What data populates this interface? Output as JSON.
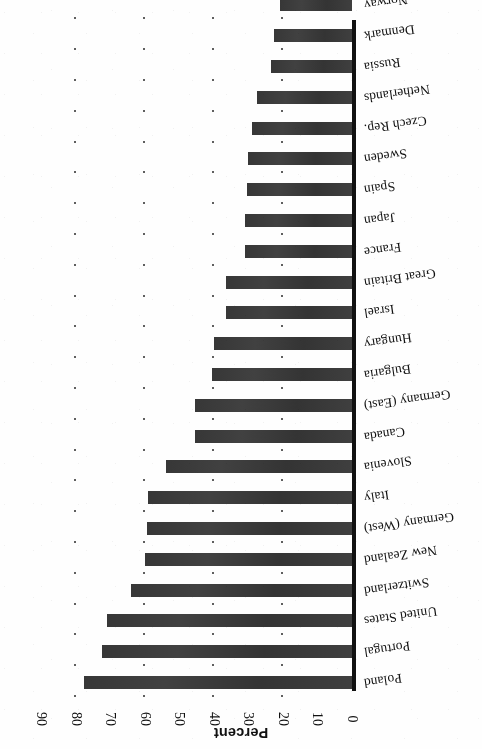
{
  "chart_data": {
    "type": "bar",
    "orientation": "horizontal",
    "title": "",
    "subtitle": "",
    "xlabel": "Percent",
    "ylabel": "",
    "xlim": [
      0,
      90
    ],
    "xticks": [
      0,
      10,
      20,
      30,
      40,
      50,
      60,
      70,
      80,
      90
    ],
    "xtick_labels": [
      "0",
      "10",
      "20",
      "30",
      "40",
      "50",
      "60",
      "70",
      "80",
      "90"
    ],
    "grid": "dotted",
    "grid_interval": 20,
    "legend": "none",
    "bar_color": "#3a3a3a",
    "axis_color": "#111111",
    "rotation_note": "figure rendered rotated 180 degrees",
    "categories": [
      "Poland",
      "Portugal",
      "United States",
      "Switzerland",
      "New Zealand",
      "Germany (West)",
      "Italy",
      "Slovenia",
      "Canada",
      "Germany (East)",
      "Bulgaria",
      "Hungary",
      "Israel",
      "Great Britain",
      "France",
      "Japan",
      "Spain",
      "Sweden",
      "Czech Rep.",
      "Netherlands",
      "Russia",
      "Denmark",
      "Norway"
    ],
    "values": [
      77.7,
      72.5,
      71.0,
      64.0,
      60.0,
      59.5,
      59.0,
      54.0,
      45.5,
      45.5,
      40.5,
      40.0,
      36.5,
      36.5,
      31.0,
      31.0,
      30.5,
      30.0,
      29.0,
      27.5,
      23.5,
      22.5,
      21.0
    ]
  },
  "axis": {
    "title": "Percent"
  }
}
